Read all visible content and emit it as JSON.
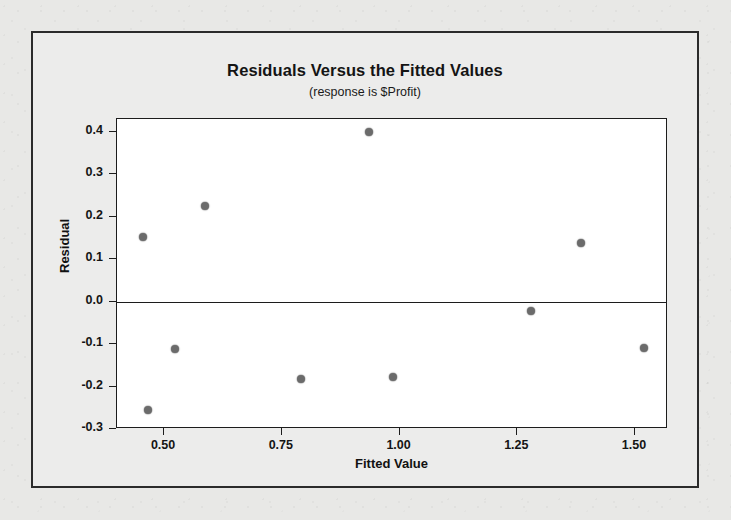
{
  "chart_data": {
    "type": "scatter",
    "title": "Residuals Versus the Fitted Values",
    "subtitle": "(response is $Profit)",
    "xlabel": "Fitted Value",
    "ylabel": "Residual",
    "xlim": [
      0.4,
      1.57
    ],
    "ylim": [
      -0.3,
      0.43
    ],
    "grid": false,
    "legend": null,
    "reference_line": {
      "orientation": "horizontal",
      "y": 0.0
    },
    "xticks": [
      0.5,
      0.75,
      1.0,
      1.25,
      1.5
    ],
    "xtick_labels": [
      "0.50",
      "0.75",
      "1.00",
      "1.25",
      "1.50"
    ],
    "yticks": [
      0.4,
      0.3,
      0.2,
      0.1,
      0.0,
      -0.1,
      -0.2,
      -0.3
    ],
    "ytick_labels": [
      "0.4",
      "0.3",
      "0.2",
      "0.1",
      "0.0",
      "-0.1",
      "-0.2",
      "-0.3"
    ],
    "marker_color": "#6b6b6b",
    "points": [
      {
        "x": 0.456,
        "y": 0.151
      },
      {
        "x": 0.465,
        "y": -0.256
      },
      {
        "x": 0.523,
        "y": -0.111
      },
      {
        "x": 0.587,
        "y": 0.226
      },
      {
        "x": 0.79,
        "y": -0.182
      },
      {
        "x": 0.935,
        "y": 0.4
      },
      {
        "x": 0.985,
        "y": -0.177
      },
      {
        "x": 1.28,
        "y": -0.023
      },
      {
        "x": 1.385,
        "y": 0.137
      },
      {
        "x": 1.52,
        "y": -0.11
      }
    ]
  }
}
